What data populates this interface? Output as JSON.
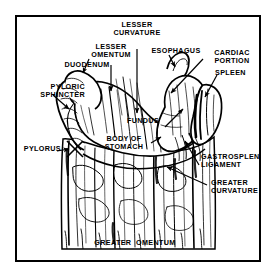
{
  "figure": {
    "style": "black-and-white line drawing with leader-line callouts",
    "frame_color": "#000000",
    "background_color": "#ffffff",
    "ink_color": "#000000"
  },
  "labels": [
    {
      "id": "lesser-curvature",
      "text": "LESSER\nCURVATURE",
      "side": "center"
    },
    {
      "id": "lesser-omentum",
      "text": "LESSER\nOMENTUM",
      "side": "center"
    },
    {
      "id": "esophagus",
      "text": "ESOPHAGUS",
      "side": "center"
    },
    {
      "id": "cardiac-portion",
      "text": "CARDIAC\nPORTION",
      "side": "center"
    },
    {
      "id": "duodenum",
      "text": "DUODENUM",
      "side": "center"
    },
    {
      "id": "spleen",
      "text": "SPLEEN",
      "side": "right"
    },
    {
      "id": "pyloric-sphincter",
      "text": "PYLORIC\nSPHINCTER",
      "side": "left"
    },
    {
      "id": "fundus",
      "text": "FUNDUS",
      "side": "right"
    },
    {
      "id": "body-of-stomach",
      "text": "BODY OF\nSTOMACH",
      "side": "center"
    },
    {
      "id": "pylorus",
      "text": "PYLORUS",
      "side": "left"
    },
    {
      "id": "gastrosplenic-ligament",
      "text": "GASTROSPLENIC\nLIGAMENT",
      "side": "right"
    },
    {
      "id": "greater-curvature",
      "text": "GREATER\nCURVATURE",
      "side": "right"
    },
    {
      "id": "greater-omentum",
      "text": "GREATER  OMENTUM",
      "side": "center"
    }
  ]
}
